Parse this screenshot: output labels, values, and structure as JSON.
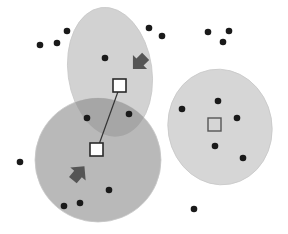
{
  "diagram": {
    "title": "",
    "kind": "k-means clustering illustration",
    "colors": {
      "background": "#ffffff",
      "cluster_top": "#d2d2d2",
      "cluster_bottom_left": "#b9b9b9",
      "cluster_right": "#d6d6d6",
      "cluster_overlap": "#a6a6a6",
      "cluster_edge": "#c8c8c8",
      "point": "#1a1a1a",
      "centroid_fill": "#ffffff",
      "centroid_stroke": "#2a2a2a",
      "centroid_empty_stroke": "#555555",
      "arrow": "#555555",
      "link": "#333333"
    },
    "clusters": [
      {
        "id": "top",
        "label": "cluster-top"
      },
      {
        "id": "bottom-left",
        "label": "cluster-bottom-left"
      },
      {
        "id": "right",
        "label": "cluster-right"
      }
    ],
    "points": [
      {
        "cluster": "none",
        "x": 40,
        "y": 45
      },
      {
        "cluster": "none",
        "x": 57,
        "y": 43
      },
      {
        "cluster": "none",
        "x": 67,
        "y": 31
      },
      {
        "cluster": "none",
        "x": 208,
        "y": 32
      },
      {
        "cluster": "none",
        "x": 229,
        "y": 31
      },
      {
        "cluster": "none",
        "x": 223,
        "y": 42
      },
      {
        "cluster": "none",
        "x": 20,
        "y": 162
      },
      {
        "cluster": "none",
        "x": 194,
        "y": 209
      },
      {
        "cluster": "top",
        "x": 105,
        "y": 58
      },
      {
        "cluster": "top",
        "x": 149,
        "y": 28
      },
      {
        "cluster": "top",
        "x": 162,
        "y": 36
      },
      {
        "cluster": "overlap",
        "x": 87,
        "y": 118
      },
      {
        "cluster": "overlap",
        "x": 129,
        "y": 114
      },
      {
        "cluster": "bottom-left",
        "x": 109,
        "y": 190
      },
      {
        "cluster": "bottom-left",
        "x": 80,
        "y": 203
      },
      {
        "cluster": "bottom-left",
        "x": 64,
        "y": 206
      },
      {
        "cluster": "right",
        "x": 182,
        "y": 109
      },
      {
        "cluster": "right",
        "x": 218,
        "y": 101
      },
      {
        "cluster": "right",
        "x": 237,
        "y": 118
      },
      {
        "cluster": "right",
        "x": 215,
        "y": 146
      },
      {
        "cluster": "right",
        "x": 243,
        "y": 158
      }
    ],
    "centroids": [
      {
        "cluster": "top",
        "style": "filled"
      },
      {
        "cluster": "bottom-left",
        "style": "filled"
      },
      {
        "cluster": "right",
        "style": "empty"
      }
    ],
    "arrows": [
      {
        "cluster": "top",
        "direction": "down-left"
      },
      {
        "cluster": "bottom-left",
        "direction": "up-right"
      }
    ]
  }
}
